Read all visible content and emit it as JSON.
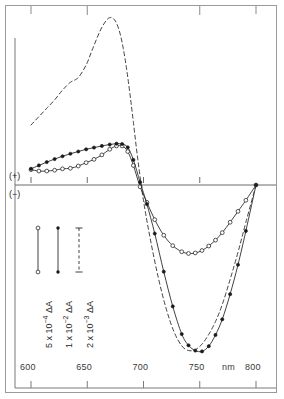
{
  "figure": {
    "axis_sign_positive": "(+)",
    "axis_sign_negative": "(−)",
    "x_unit_label": "nm"
  },
  "legend": {
    "entries": [
      {
        "label_prefix": "5 x 10",
        "exponent": "−4",
        "label_suffix": " ΔA",
        "marker": "open-circle",
        "line": "solid"
      },
      {
        "label_prefix": "1 x 10",
        "exponent": "−2",
        "label_suffix": " ΔA",
        "marker": "filled-circle",
        "line": "solid"
      },
      {
        "label_prefix": "2 x 10",
        "exponent": "−3",
        "label_suffix": " ΔA",
        "marker": "bar-cap",
        "line": "dashed"
      }
    ]
  },
  "chart_data": {
    "type": "line",
    "title": "",
    "subtitle": "",
    "xlabel": "nm",
    "ylabel": "ΔA",
    "xlim": [
      595,
      805
    ],
    "ylim": [
      -1.05,
      0.62
    ],
    "grid": false,
    "legend_position": "lower-left",
    "axis_notes": "Vertical axis is signed difference absorbance; (+) above zero line, (−) below. Zero baseline drawn across plot.",
    "x_ticks": [
      600,
      650,
      700,
      750,
      800
    ],
    "x_tick_labels": [
      "600",
      "650",
      "700",
      "750",
      "800"
    ],
    "series": [
      {
        "name": "5 x 10^-4 ΔA",
        "marker": "open-circle",
        "line": "solid",
        "scale_label": "5 x 10−4 ΔA",
        "x": [
          600,
          607,
          614,
          621,
          628,
          635,
          642,
          649,
          656,
          663,
          670,
          676,
          681,
          686,
          691,
          697,
          703,
          710,
          718,
          726,
          734,
          740,
          746,
          752,
          758,
          764,
          770,
          777,
          784,
          791,
          800
        ],
        "y": [
          0.055,
          0.05,
          0.05,
          0.053,
          0.058,
          0.06,
          0.068,
          0.08,
          0.092,
          0.108,
          0.128,
          0.14,
          0.14,
          0.12,
          0.07,
          -0.01,
          -0.1,
          -0.2,
          -0.29,
          -0.35,
          -0.385,
          -0.395,
          -0.392,
          -0.378,
          -0.352,
          -0.318,
          -0.275,
          -0.215,
          -0.152,
          -0.088,
          0.0
        ]
      },
      {
        "name": "1 x 10^-2 ΔA",
        "marker": "filled-circle",
        "line": "solid",
        "scale_label": "1 x 10−2 ΔA",
        "x": [
          600,
          607,
          614,
          621,
          628,
          635,
          642,
          649,
          656,
          663,
          670,
          676,
          681,
          686,
          691,
          697,
          703,
          710,
          718,
          726,
          734,
          740,
          746,
          752,
          758,
          764,
          770,
          777,
          784,
          791,
          800
        ],
        "y": [
          0.058,
          0.07,
          0.082,
          0.093,
          0.103,
          0.112,
          0.12,
          0.128,
          0.134,
          0.14,
          0.145,
          0.148,
          0.147,
          0.135,
          0.09,
          0.01,
          -0.11,
          -0.28,
          -0.5,
          -0.7,
          -0.86,
          -0.925,
          -0.955,
          -0.96,
          -0.93,
          -0.865,
          -0.775,
          -0.63,
          -0.46,
          -0.265,
          0.0
        ]
      },
      {
        "name": "2 x 10^-3 ΔA",
        "marker": "none",
        "line": "dashed",
        "scale_label": "2 x 10−3 ΔA",
        "x": [
          600,
          607,
          614,
          621,
          628,
          635,
          642,
          649,
          654,
          659,
          663,
          667,
          670,
          673,
          676,
          679,
          682,
          685,
          688,
          691,
          695,
          700,
          706,
          713,
          720,
          727,
          734,
          740,
          746,
          752,
          758,
          764,
          770,
          777,
          784,
          791,
          800
        ],
        "y": [
          0.215,
          0.245,
          0.275,
          0.305,
          0.34,
          0.368,
          0.385,
          0.43,
          0.48,
          0.53,
          0.565,
          0.59,
          0.6,
          0.597,
          0.58,
          0.545,
          0.49,
          0.415,
          0.325,
          0.225,
          0.09,
          -0.09,
          -0.31,
          -0.53,
          -0.71,
          -0.845,
          -0.928,
          -0.955,
          -0.95,
          -0.918,
          -0.862,
          -0.788,
          -0.69,
          -0.545,
          -0.388,
          -0.215,
          0.0
        ]
      }
    ]
  }
}
